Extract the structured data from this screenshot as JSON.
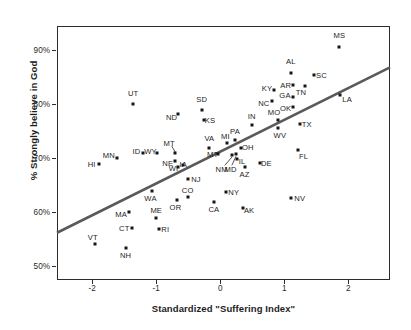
{
  "chart_data": {
    "type": "scatter",
    "title": "",
    "xlabel": "Standardized \"Suffering Index\"",
    "ylabel": "% Strongly believe in God",
    "xlim": [
      -2.55,
      2.65
    ],
    "ylim": [
      0.475,
      0.945
    ],
    "grid": false,
    "legend": null,
    "xticks": [
      -2,
      -1,
      0,
      1,
      2
    ],
    "xtick_labels": [
      "-2",
      "-1",
      "0",
      "1",
      "2"
    ],
    "yticks": [
      0.5,
      0.6,
      0.7,
      0.8,
      0.9
    ],
    "ytick_labels": [
      "50%",
      "60%",
      "70%",
      "80%",
      "90%"
    ],
    "trendline": {
      "label": "linear fit",
      "x": [
        -2.55,
        2.65
      ],
      "y": [
        0.5625,
        0.8685
      ],
      "color": "#5a5a5a"
    },
    "point_color": "#161616",
    "points": [
      {
        "label": "MS",
        "x": 1.86,
        "y": 0.906,
        "lx": 1.86,
        "ly": 0.929
      },
      {
        "label": "AL",
        "x": 1.1,
        "y": 0.858,
        "lx": 1.1,
        "ly": 0.88
      },
      {
        "label": "SC",
        "x": 1.46,
        "y": 0.854,
        "lx": 1.58,
        "ly": 0.854
      },
      {
        "label": "AR",
        "x": 1.14,
        "y": 0.835,
        "lx": 1.02,
        "ly": 0.835
      },
      {
        "label": "TN",
        "x": 1.32,
        "y": 0.834,
        "lx": 1.26,
        "ly": 0.823
      },
      {
        "label": "KY",
        "x": 0.84,
        "y": 0.827,
        "lx": 0.73,
        "ly": 0.831
      },
      {
        "label": "GA",
        "x": 1.13,
        "y": 0.814,
        "lx": 1.01,
        "ly": 0.818
      },
      {
        "label": "LA",
        "x": 1.87,
        "y": 0.818,
        "lx": 1.98,
        "ly": 0.81
      },
      {
        "label": "NC",
        "x": 0.8,
        "y": 0.806,
        "lx": 0.68,
        "ly": 0.803
      },
      {
        "label": "UT",
        "x": -1.36,
        "y": 0.801,
        "lx": -1.36,
        "ly": 0.821
      },
      {
        "label": "OK",
        "x": 1.13,
        "y": 0.796,
        "lx": 1.02,
        "ly": 0.794
      },
      {
        "label": "SD",
        "x": -0.29,
        "y": 0.789,
        "lx": -0.29,
        "ly": 0.81
      },
      {
        "label": "ND",
        "x": -0.66,
        "y": 0.783,
        "lx": -0.76,
        "ly": 0.777
      },
      {
        "label": "MO",
        "x": 0.9,
        "y": 0.771,
        "lx": 0.84,
        "ly": 0.785
      },
      {
        "label": "KS",
        "x": -0.26,
        "y": 0.771,
        "lx": -0.16,
        "ly": 0.771
      },
      {
        "label": "IN",
        "x": 0.49,
        "y": 0.762,
        "lx": 0.49,
        "ly": 0.779
      },
      {
        "label": "TX",
        "x": 1.24,
        "y": 0.763,
        "lx": 1.35,
        "ly": 0.763
      },
      {
        "label": "WV",
        "x": 0.9,
        "y": 0.756,
        "lx": 0.93,
        "ly": 0.744
      },
      {
        "label": "PA",
        "x": 0.23,
        "y": 0.734,
        "lx": 0.23,
        "ly": 0.75
      },
      {
        "label": "MI",
        "x": 0.1,
        "y": 0.728,
        "lx": 0.08,
        "ly": 0.742
      },
      {
        "label": "VA",
        "x": -0.17,
        "y": 0.719,
        "lx": -0.17,
        "ly": 0.737
      },
      {
        "label": "OH",
        "x": 0.32,
        "y": 0.719,
        "lx": 0.43,
        "ly": 0.722
      },
      {
        "label": "FL",
        "x": 1.22,
        "y": 0.716,
        "lx": 1.3,
        "ly": 0.704
      },
      {
        "label": "WY",
        "x": -0.99,
        "y": 0.71,
        "lx": -1.09,
        "ly": 0.714
      },
      {
        "label": "MT",
        "x": -0.7,
        "y": 0.71,
        "lx": -0.8,
        "ly": 0.729
      },
      {
        "label": "MT",
        "x": -0.03,
        "y": 0.709,
        "lx": -0.12,
        "ly": 0.709
      },
      {
        "label": "ID",
        "x": -1.21,
        "y": 0.71,
        "lx": -1.31,
        "ly": 0.714
      },
      {
        "label": "MN",
        "x": -1.62,
        "y": 0.7,
        "lx": -1.74,
        "ly": 0.706
      },
      {
        "label": "IL",
        "x": 0.26,
        "y": 0.698,
        "lx": 0.34,
        "ly": 0.695
      },
      {
        "label": "HI",
        "x": -1.9,
        "y": 0.69,
        "lx": -2.01,
        "ly": 0.69
      },
      {
        "label": "NE",
        "x": -0.71,
        "y": 0.695,
        "lx": -0.82,
        "ly": 0.692
      },
      {
        "label": "DE",
        "x": 0.62,
        "y": 0.691,
        "lx": 0.72,
        "ly": 0.691
      },
      {
        "label": "IA",
        "x": -0.59,
        "y": 0.687,
        "lx": -0.58,
        "ly": 0.69
      },
      {
        "label": "WI",
        "x": -0.66,
        "y": 0.684,
        "lx": -0.73,
        "ly": 0.682
      },
      {
        "label": "MD",
        "x": 0.25,
        "y": 0.708,
        "lx": 0.16,
        "ly": 0.681
      },
      {
        "label": "NM",
        "x": 0.19,
        "y": 0.707,
        "lx": 0.02,
        "ly": 0.681
      },
      {
        "label": "AZ",
        "x": 0.38,
        "y": 0.685,
        "lx": 0.38,
        "ly": 0.672
      },
      {
        "label": "NJ",
        "x": -0.5,
        "y": 0.661,
        "lx": -0.38,
        "ly": 0.661
      },
      {
        "label": "WA",
        "x": -1.07,
        "y": 0.64,
        "lx": -1.09,
        "ly": 0.627
      },
      {
        "label": "NY",
        "x": 0.09,
        "y": 0.637,
        "lx": 0.21,
        "ly": 0.637
      },
      {
        "label": "CO",
        "x": -0.51,
        "y": 0.628,
        "lx": -0.51,
        "ly": 0.641
      },
      {
        "label": "NV",
        "x": 1.11,
        "y": 0.627,
        "lx": 1.24,
        "ly": 0.627
      },
      {
        "label": "OR",
        "x": -0.68,
        "y": 0.623,
        "lx": -0.7,
        "ly": 0.611
      },
      {
        "label": "CA",
        "x": -0.1,
        "y": 0.62,
        "lx": -0.1,
        "ly": 0.606
      },
      {
        "label": "AK",
        "x": 0.36,
        "y": 0.608,
        "lx": 0.45,
        "ly": 0.604
      },
      {
        "label": "MA",
        "x": -1.43,
        "y": 0.6,
        "lx": -1.55,
        "ly": 0.598
      },
      {
        "label": "ME",
        "x": -1.0,
        "y": 0.59,
        "lx": -1.0,
        "ly": 0.604
      },
      {
        "label": "CT",
        "x": -1.38,
        "y": 0.571,
        "lx": -1.5,
        "ly": 0.571
      },
      {
        "label": "RI",
        "x": -0.96,
        "y": 0.57,
        "lx": -0.86,
        "ly": 0.57
      },
      {
        "label": "VT",
        "x": -1.96,
        "y": 0.541,
        "lx": -1.99,
        "ly": 0.554
      },
      {
        "label": "NH",
        "x": -1.48,
        "y": 0.535,
        "lx": -1.48,
        "ly": 0.521
      }
    ],
    "leader_lines": [
      {
        "from_label": "MT",
        "x1": -0.76,
        "y1": 0.723,
        "x2": -0.705,
        "y2": 0.712
      },
      {
        "from_label": "NM",
        "x1": 0.07,
        "y1": 0.687,
        "x2": 0.185,
        "y2": 0.703
      },
      {
        "from_label": "MD",
        "x1": 0.18,
        "y1": 0.687,
        "x2": 0.245,
        "y2": 0.704
      }
    ]
  }
}
